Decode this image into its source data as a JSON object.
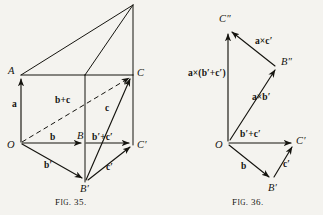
{
  "page": {
    "background": "#f4f3ef",
    "ink": "#15140f",
    "width": 323,
    "height": 215
  },
  "figure35": {
    "caption_prefix": "F",
    "caption_small": "IG",
    "caption_suffix": ". 35.",
    "caption_full": "Fig. 35.",
    "points": {
      "O": "O",
      "A": "A",
      "B": "B",
      "Bp": "B′",
      "C": "C",
      "Cp": "C′"
    },
    "vectors": {
      "a": "a",
      "b": "b",
      "c": "c",
      "bp": "b′",
      "cp": "c′",
      "b_plus_c": "b+c",
      "bp_plus_cp": "b′+c′"
    }
  },
  "figure36": {
    "caption_full": "Fig. 36.",
    "points": {
      "O": "O",
      "Bp": "B′",
      "Cp": "C′",
      "Bpp": "B″",
      "Cpp": "C″"
    },
    "vectors": {
      "b": "b",
      "cp": "c′",
      "bp_plus_cp": "b′+c′",
      "a_cross_bp": "a×b′",
      "a_cross_cp": "a×c′",
      "a_cross_sum": "a×(b′+c′)"
    }
  }
}
